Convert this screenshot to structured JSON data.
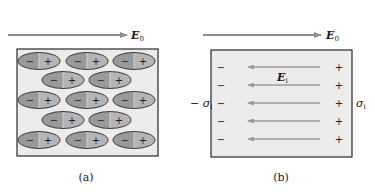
{
  "colors": {
    "arrow": "#8f8f8f",
    "box_fill": "#ececec",
    "box_stroke": "#2a2a2a",
    "ellipse_left": "#9a9a9a",
    "ellipse_right": "#b4b4b4",
    "ellipse_stroke": "#3a3a3a",
    "text": "#1a1a1a"
  },
  "panel_a": {
    "field_label": "E",
    "field_subscript": "0",
    "caption": "(a)",
    "dipole_rows": [
      3,
      2,
      3,
      2,
      3
    ],
    "dipole_negative_sign": "−",
    "dipole_positive_sign": "+"
  },
  "panel_b": {
    "field_label": "E",
    "field_subscript": "0",
    "inner_field_label": "E",
    "inner_field_subscript": "i",
    "left_surface_label": "− σ",
    "left_surface_subscript": "i",
    "right_surface_label": "σ",
    "right_surface_subscript": "i",
    "caption": "(b)",
    "row_count": 5,
    "negative_sign": "−",
    "positive_sign": "+"
  }
}
